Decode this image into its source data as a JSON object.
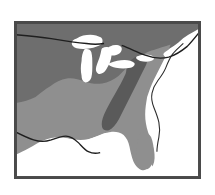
{
  "figure": {
    "type": "distribution-range-map",
    "region": "Eastern United States",
    "title": "",
    "caption": "",
    "projection": "equirectangular",
    "canvas": {
      "width": 215,
      "height": 195
    },
    "frame": {
      "x": 14,
      "y": 21,
      "width": 187,
      "height": 158,
      "border_color": "#4a4a4a",
      "border_width": 2
    }
  },
  "palette": {
    "background": "#ffffff",
    "water": "#ffffff",
    "frame_border": "#4a4a4a",
    "zone_north": "#6e6e6e",
    "zone_south": "#8f8f8f",
    "zone_highland": "#5a5a5a",
    "coastline": "#2b2b2b",
    "border_line": "#1f1f1f"
  },
  "layers": [
    {
      "id": "zone-north",
      "name": "Northern shaded range",
      "fill": "#6e6e6e",
      "description": "Dark gray shading covering the upper Midwest, Great Lakes states, and Northeast"
    },
    {
      "id": "zone-south",
      "name": "Southern shaded range",
      "fill": "#8f8f8f",
      "description": "Medium gray shading covering the Southeast, Gulf states, Texas, and Florida"
    },
    {
      "id": "zone-highland",
      "name": "Appalachian highland band",
      "fill": "#5a5a5a",
      "description": "Darker diagonal band running from the lower Great Lakes southwest to northern Georgia"
    },
    {
      "id": "great-lakes",
      "name": "Great Lakes",
      "fill": "#ffffff",
      "description": "Lake Superior, Michigan, Huron, Erie and Ontario rendered in white"
    },
    {
      "id": "atlantic-ocean",
      "name": "Atlantic Ocean",
      "fill": "#ffffff",
      "description": "White ocean area east of the coastline"
    },
    {
      "id": "gulf-of-mexico",
      "name": "Gulf of Mexico",
      "fill": "#ffffff",
      "description": "White water area along the southern edge"
    }
  ],
  "boundaries": [
    {
      "id": "canada-border",
      "name": "United States - Canada border",
      "stroke": "#1f1f1f",
      "description": "Dark line running east-west across the top of the map"
    },
    {
      "id": "mexico-border",
      "name": "United States - Mexico border",
      "stroke": "#1f1f1f",
      "description": "Dark line along the Rio Grande in the lower left"
    },
    {
      "id": "atlantic-coastline",
      "name": "Atlantic coastline",
      "stroke": "#2b2b2b",
      "description": "Irregular coastline from Maine south to Florida"
    }
  ],
  "labels": [],
  "legend": {
    "visible": false,
    "entries": []
  }
}
